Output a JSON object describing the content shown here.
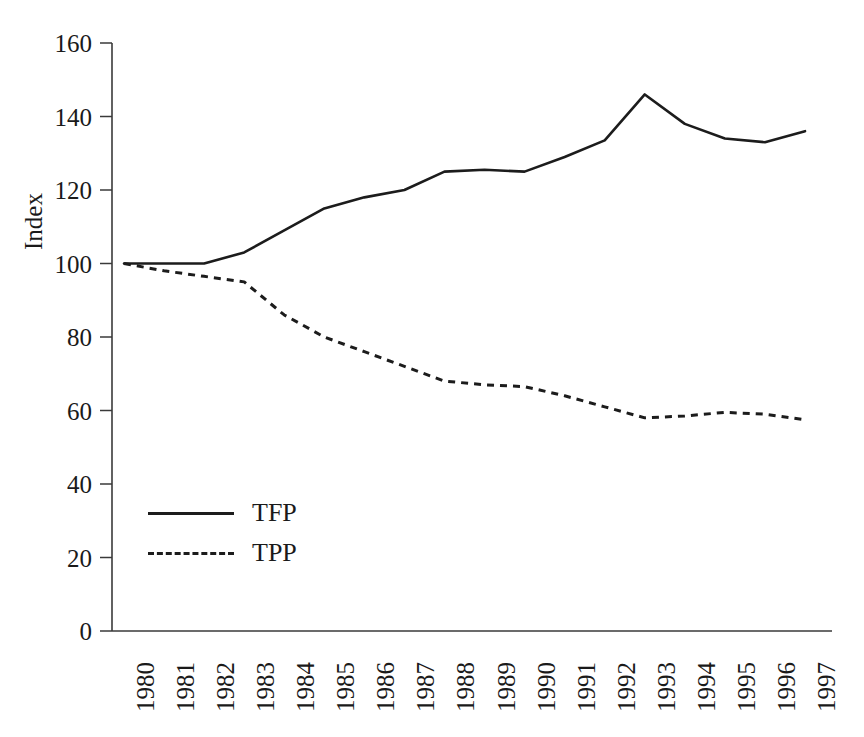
{
  "chart_data": {
    "type": "line",
    "title": "",
    "xlabel": "",
    "ylabel": "Index",
    "ylim": [
      0,
      160
    ],
    "yticks": [
      0,
      20,
      40,
      60,
      80,
      100,
      120,
      140,
      160
    ],
    "grid": false,
    "legend_position": "inside-lower-left",
    "categories": [
      "1980",
      "1981",
      "1982",
      "1983",
      "1984",
      "1985",
      "1986",
      "1987",
      "1988",
      "1989",
      "1990",
      "1991",
      "1992",
      "1993",
      "1994",
      "1995",
      "1996",
      "1997"
    ],
    "series": [
      {
        "name": "TFP",
        "style": "solid",
        "color": "#1c1c1c",
        "values": [
          100,
          100,
          100,
          103,
          109,
          115,
          118,
          120,
          125,
          125.5,
          125,
          129,
          133.5,
          146,
          138,
          134,
          133,
          136
        ]
      },
      {
        "name": "TPP",
        "style": "dashed",
        "color": "#1c1c1c",
        "values": [
          100,
          98,
          96.5,
          95,
          86,
          80,
          76,
          72,
          68,
          67,
          66.5,
          64,
          61,
          58,
          58.5,
          59.5,
          59,
          57.5
        ]
      }
    ]
  },
  "legend": {
    "entries": [
      {
        "label": "TFP",
        "style": "solid"
      },
      {
        "label": "TPP",
        "style": "dashed"
      }
    ]
  },
  "axes": {
    "y_axis_label": "Index",
    "y_tick_labels": [
      "160",
      "140",
      "120",
      "100",
      "80",
      "60",
      "40",
      "20",
      "0"
    ],
    "x_tick_labels": [
      "1980",
      "1981",
      "1982",
      "1983",
      "1984",
      "1985",
      "1986",
      "1987",
      "1988",
      "1989",
      "1990",
      "1991",
      "1992",
      "1993",
      "1994",
      "1995",
      "1996",
      "1997"
    ]
  }
}
